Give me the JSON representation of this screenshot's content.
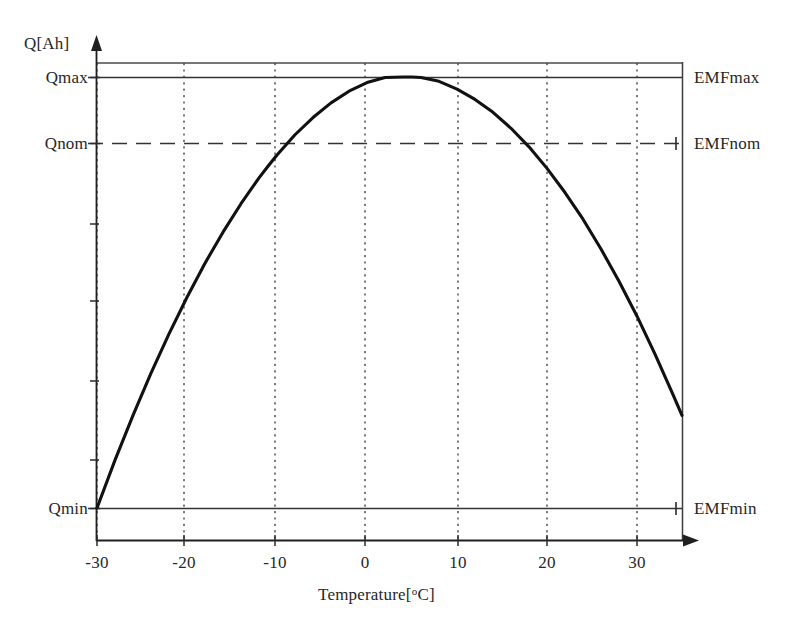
{
  "figure": {
    "background_color": "#ffffff",
    "ink_color": "#262626",
    "curve_color": "#111111"
  },
  "axes": {
    "y_title": "Q[Ah]",
    "x_title_prefix": "Temperature[",
    "x_title_degree": "o",
    "x_title_suffix": "C]",
    "x_title_full": "Temperature[oC]"
  },
  "y_labels_left": [
    {
      "name": "qmax",
      "text": "Qmax",
      "value_px_y": 77
    },
    {
      "name": "qnom",
      "text": "Qnom",
      "value_px_y": 143
    },
    {
      "name": "qmin",
      "text": "Qmin",
      "value_px_y": 508
    }
  ],
  "y_labels_right": [
    {
      "name": "emfmax",
      "text": "EMFmax",
      "value_px_y": 77
    },
    {
      "name": "emfnom",
      "text": "EMFnom",
      "value_px_y": 143
    },
    {
      "name": "emfmin",
      "text": "EMFmin",
      "value_px_y": 508
    }
  ],
  "x_ticks": [
    {
      "label": "-30",
      "px": 97
    },
    {
      "label": "-20",
      "px": 184
    },
    {
      "label": "-10",
      "px": 275
    },
    {
      "label": "0",
      "px": 365
    },
    {
      "label": "10",
      "px": 458
    },
    {
      "label": "20",
      "px": 547
    },
    {
      "label": "30",
      "px": 637
    }
  ],
  "chart_data": {
    "type": "line",
    "title": "",
    "subtitle": "",
    "xlabel": "Temperature[oC]",
    "ylabel": "Q[Ah]",
    "xlim": [
      -30,
      35
    ],
    "ylim_labels": [
      "Qmin",
      "Qnom",
      "Qmax"
    ],
    "grid": "vertical dotted gridlines at every x tick",
    "legend": "none",
    "x_tick_labels": [
      "-30",
      "-20",
      "-10",
      "0",
      "10",
      "20",
      "30"
    ],
    "x_tick_values": [
      -30,
      -20,
      -10,
      0,
      10,
      20,
      30
    ],
    "y_reference_lines": [
      {
        "name": "top-frame",
        "label": "",
        "style": "solid",
        "level": "above Qmax"
      },
      {
        "name": "Qmax",
        "label": "Qmax",
        "right_label": "EMFmax",
        "style": "solid"
      },
      {
        "name": "Qnom",
        "label": "Qnom",
        "right_label": "EMFnom",
        "style": "dashed"
      },
      {
        "name": "Qmin",
        "label": "Qmin",
        "right_label": "EMFmin",
        "style": "solid"
      }
    ],
    "series": [
      {
        "name": "capacity-vs-temperature",
        "description": "Inverted parabola: capacity rises from Qmin at -30 degC, peaks at Qmax near +5 degC, falls again toward higher temperature.",
        "x": [
          -30,
          -28,
          -26,
          -24,
          -22,
          -20,
          -18,
          -16,
          -14,
          -12,
          -11,
          -10,
          -8,
          -6,
          -4,
          -2,
          0,
          2,
          4,
          5,
          6,
          8,
          10,
          12,
          14,
          16,
          18,
          20,
          22,
          24,
          26,
          28,
          30,
          32,
          34,
          35
        ],
        "y_norm": [
          0.0,
          0.111,
          0.215,
          0.313,
          0.404,
          0.489,
          0.568,
          0.64,
          0.706,
          0.766,
          0.793,
          0.819,
          0.866,
          0.906,
          0.94,
          0.967,
          0.987,
          0.999,
          1.0,
          1.0,
          0.999,
          0.99,
          0.972,
          0.948,
          0.918,
          0.881,
          0.838,
          0.788,
          0.732,
          0.67,
          0.601,
          0.526,
          0.445,
          0.357,
          0.263,
          0.215
        ],
        "y_norm_note": "0 = Qmin line, 1 = Qmax line"
      }
    ],
    "annotations": [
      {
        "text": "Qmax",
        "position": "left of y-axis at Qmax level"
      },
      {
        "text": "Qnom",
        "position": "left of y-axis at Qnom level"
      },
      {
        "text": "Qmin",
        "position": "left of y-axis at Qmin level"
      },
      {
        "text": "EMFmax",
        "position": "right of plot frame at Qmax level"
      },
      {
        "text": "EMFnom",
        "position": "right of plot frame at Qnom level"
      },
      {
        "text": "EMFmin",
        "position": "right of plot frame at Qmin level"
      }
    ]
  }
}
